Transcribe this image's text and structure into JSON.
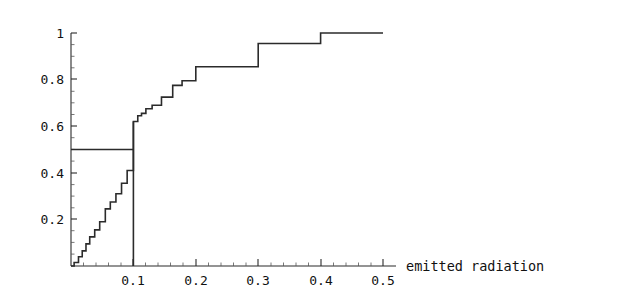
{
  "figure": {
    "width": 620,
    "height": 296,
    "background": "#ffffff",
    "line_color": "#2b2b2b",
    "text_color": "#111111"
  },
  "chart_data": {
    "type": "line",
    "subtype": "empirical-cdf-step",
    "title": "",
    "subtitle": "",
    "xlabel": "emitted radiation",
    "ylabel": "",
    "xlim": [
      0,
      0.5
    ],
    "ylim": [
      0,
      1
    ],
    "grid": false,
    "legend": null,
    "xticks": [
      0,
      0.1,
      0.2,
      0.3,
      0.4,
      0.5
    ],
    "xtick_labels": [
      "",
      "0.1",
      "0.2",
      "0.3",
      "0.4",
      "0.5"
    ],
    "yticks": [
      0,
      0.2,
      0.4,
      0.6,
      0.8,
      1
    ],
    "ytick_labels": [
      "",
      "0.2",
      "0.4",
      "0.6",
      "0.8",
      "1"
    ],
    "x_minor_tick_step": 0.02,
    "y_minor_tick_step": 0.05,
    "series": [
      {
        "name": "empirical CDF",
        "style": "step-post",
        "x": [
          0.005,
          0.012,
          0.018,
          0.024,
          0.03,
          0.038,
          0.046,
          0.055,
          0.063,
          0.072,
          0.081,
          0.09,
          0.1,
          0.107,
          0.113,
          0.12,
          0.13,
          0.145,
          0.163,
          0.178,
          0.2,
          0.3,
          0.4,
          0.5
        ],
        "y": [
          0.015,
          0.04,
          0.065,
          0.095,
          0.125,
          0.155,
          0.19,
          0.245,
          0.275,
          0.31,
          0.355,
          0.41,
          0.62,
          0.645,
          0.655,
          0.675,
          0.69,
          0.725,
          0.775,
          0.795,
          0.855,
          0.955,
          1.0,
          1.0
        ]
      },
      {
        "name": "median guide horizontal",
        "style": "segment",
        "x": [
          0.0,
          0.1
        ],
        "y": [
          0.5,
          0.5
        ]
      },
      {
        "name": "median guide vertical",
        "style": "segment",
        "x": [
          0.1,
          0.1
        ],
        "y": [
          0.0,
          0.62
        ]
      }
    ],
    "annotations": [
      {
        "text": "emitted radiation",
        "x": 0.53,
        "y": 0.0,
        "role": "x-axis-title"
      }
    ]
  }
}
